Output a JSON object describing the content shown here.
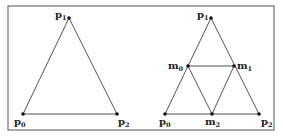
{
  "figure": {
    "frame": {
      "x": 8,
      "y": 6,
      "width": 266,
      "height": 124,
      "stroke": "#555555"
    },
    "line_color": "#555555",
    "point_color": "#111111",
    "left_triangle": {
      "points": [
        {
          "id": "p0",
          "base": "p",
          "sub": "0",
          "x": 23,
          "y": 114,
          "lx": 14,
          "ly": 125
        },
        {
          "id": "p1",
          "base": "p",
          "sub": "1",
          "x": 69,
          "y": 18,
          "lx": 55,
          "ly": 18
        },
        {
          "id": "p2",
          "base": "p",
          "sub": "2",
          "x": 117,
          "y": 114,
          "lx": 118,
          "ly": 125
        }
      ],
      "edges": [
        [
          "p0",
          "p1"
        ],
        [
          "p1",
          "p2"
        ],
        [
          "p2",
          "p0"
        ]
      ]
    },
    "right_triangle": {
      "points": [
        {
          "id": "p0",
          "base": "p",
          "sub": "0",
          "x": 165,
          "y": 114,
          "lx": 159,
          "ly": 125
        },
        {
          "id": "p1",
          "base": "p",
          "sub": "1",
          "x": 211,
          "y": 18,
          "lx": 197,
          "ly": 18
        },
        {
          "id": "p2",
          "base": "p",
          "sub": "2",
          "x": 259,
          "y": 114,
          "lx": 261,
          "ly": 125
        },
        {
          "id": "m0",
          "base": "m",
          "sub": "0",
          "x": 188,
          "y": 66,
          "lx": 168,
          "ly": 69
        },
        {
          "id": "m1",
          "base": "m",
          "sub": "1",
          "x": 234,
          "y": 66,
          "lx": 237,
          "ly": 69
        },
        {
          "id": "m2",
          "base": "m",
          "sub": "2",
          "x": 212,
          "y": 114,
          "lx": 205,
          "ly": 125
        }
      ],
      "edges": [
        [
          "p0",
          "p1"
        ],
        [
          "p1",
          "p2"
        ],
        [
          "p2",
          "p0"
        ],
        [
          "m0",
          "m1"
        ],
        [
          "m1",
          "m2"
        ],
        [
          "m2",
          "m0"
        ]
      ]
    }
  }
}
